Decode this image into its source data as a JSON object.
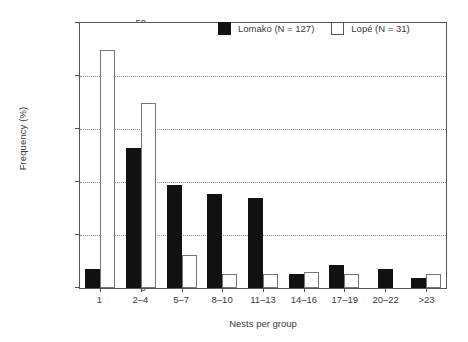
{
  "chart_data": {
    "type": "bar",
    "title": "",
    "xlabel": "Nests per group",
    "ylabel": "Frequency (%)",
    "categories": [
      "1",
      "2–4",
      "5–7",
      "8–10",
      "11–13",
      "14–16",
      "17–19",
      "20–22",
      ">23"
    ],
    "series": [
      {
        "name": "Lomako (N = 127)",
        "color": "#111111",
        "values": [
          3.5,
          26.5,
          19.5,
          17.8,
          16.9,
          2.6,
          4.4,
          3.6,
          1.9
        ]
      },
      {
        "name": "Lopé (N = 31)",
        "color": "#ffffff",
        "values": [
          45.0,
          35.0,
          6.2,
          2.7,
          2.7,
          3.0,
          2.6,
          0,
          2.6
        ]
      }
    ],
    "ylim": [
      0,
      50
    ],
    "yticks": [
      0,
      10,
      20,
      30,
      40,
      50
    ],
    "ytick_labels": [
      "0",
      "10",
      "20",
      "30",
      "40",
      "50"
    ],
    "grid": "horizontal-dotted",
    "legend_position": "top-right"
  },
  "legend": {
    "entries": [
      {
        "label": "Lomako (N = 127)",
        "style": "dark"
      },
      {
        "label": "Lopé (N = 31)",
        "style": "light"
      }
    ]
  }
}
